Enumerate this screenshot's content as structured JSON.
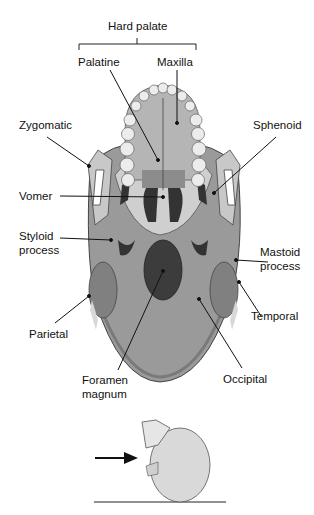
{
  "figure": {
    "group_label": "Hard palate",
    "labels": {
      "palatine": "Palatine",
      "maxilla": "Maxilla",
      "zygomatic": "Zygomatic",
      "sphenoid": "Sphenoid",
      "vomer": "Vomer",
      "styloid_1": "Styloid",
      "styloid_2": "process",
      "mastoid_1": "Mastoid",
      "mastoid_2": "process",
      "temporal": "Temporal",
      "parietal": "Parietal",
      "foramen_1": "Foramen",
      "foramen_2": "magnum",
      "occipital": "Occipital"
    },
    "colors": {
      "bone_dark": "#8e8e8e",
      "bone_mid": "#a9a9a9",
      "bone_light": "#d6d6d6",
      "teeth": "#e8e8e8",
      "foramen": "#3a3a3a",
      "line": "#111111"
    },
    "inset": {
      "description": "Orientation view: skull tilted, arrow indicating viewing direction from below",
      "arrow_icon": "right-arrow"
    }
  }
}
